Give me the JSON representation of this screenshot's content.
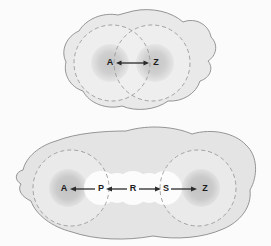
{
  "figure": {
    "background_color": "#fbfbfb",
    "panels": [
      {
        "id": "upper-panel",
        "name": "two-overlapping-regions-diagram",
        "blob": {
          "fill": "#e9e9e9",
          "stroke": "#8a8a8a"
        },
        "circles": [
          {
            "label": "A",
            "cx": 112,
            "cy": 63,
            "r": 38,
            "core_r": 17,
            "dash": "4,3",
            "stroke": "#9a9a9a",
            "fill": "#eeeeee",
            "core_fill": "#cfcfcf"
          },
          {
            "label": "Z",
            "cx": 152,
            "cy": 63,
            "r": 38,
            "core_r": 17,
            "dash": "4,3",
            "stroke": "#9a9a9a",
            "fill": "#eeeeee",
            "core_fill": "#cfcfcf"
          }
        ],
        "labels": [
          {
            "text": "A",
            "x": 110,
            "y": 63
          },
          {
            "text": "Z",
            "x": 155,
            "y": 63
          }
        ],
        "arrows": [
          {
            "from": "A",
            "to": "Z",
            "x1": 116,
            "y1": 63,
            "x2": 149,
            "y2": 63,
            "double_headed": true,
            "color": "#2b2b2b"
          }
        ]
      },
      {
        "id": "lower-panel",
        "name": "chain-of-regions-diagram",
        "blob": {
          "fill": "#e4e4e4",
          "stroke": "#8a8a8a"
        },
        "circles": [
          {
            "label": "A",
            "cx": 71,
            "cy": 188,
            "r": 38,
            "core_r": 17,
            "dash": "4,3",
            "stroke": "#9a9a9a",
            "fill": "#e9e9e9",
            "core_fill": "#c9c9c9"
          },
          {
            "label": "Z",
            "cx": 198,
            "cy": 188,
            "r": 38,
            "core_r": 17,
            "dash": "4,3",
            "stroke": "#9a9a9a",
            "fill": "#e9e9e9",
            "core_fill": "#c9c9c9"
          }
        ],
        "chain_circles": [
          {
            "cx": 101,
            "cy": 188,
            "r": 17,
            "fill": "#fbfbfb"
          },
          {
            "cx": 133,
            "cy": 188,
            "r": 17,
            "fill": "#fbfbfb"
          },
          {
            "cx": 165,
            "cy": 188,
            "r": 17,
            "fill": "#fbfbfb"
          },
          {
            "cx": 117,
            "cy": 188,
            "r": 15,
            "fill": "#fbfbfb"
          },
          {
            "cx": 149,
            "cy": 188,
            "r": 15,
            "fill": "#fbfbfb"
          }
        ],
        "labels": [
          {
            "text": "A",
            "x": 64,
            "y": 189
          },
          {
            "text": "P",
            "x": 101,
            "y": 189
          },
          {
            "text": "R",
            "x": 133,
            "y": 189
          },
          {
            "text": "S",
            "x": 166,
            "y": 189
          },
          {
            "text": "Z",
            "x": 204,
            "y": 189
          }
        ],
        "arrows": [
          {
            "from": "P",
            "to": "A",
            "x1": 96,
            "y1": 189,
            "x2": 69,
            "y2": 189,
            "direction": "left",
            "color": "#2b2b2b"
          },
          {
            "from": "R",
            "to": "P",
            "x1": 128,
            "y1": 189,
            "x2": 106,
            "y2": 189,
            "direction": "left",
            "color": "#2b2b2b"
          },
          {
            "from": "R",
            "to": "S",
            "x1": 139,
            "y1": 189,
            "x2": 161,
            "y2": 189,
            "direction": "right",
            "color": "#2b2b2b"
          },
          {
            "from": "S",
            "to": "Z",
            "x1": 171,
            "y1": 189,
            "x2": 199,
            "y2": 189,
            "direction": "right",
            "color": "#2b2b2b"
          }
        ]
      }
    ]
  }
}
